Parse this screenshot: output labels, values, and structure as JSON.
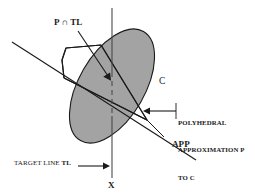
{
  "figure": {
    "type": "geometry-diagram",
    "background_color": "#ffffff",
    "stroke_color": "#1a1a1a",
    "region_fill_color": "#a3a3a3",
    "labels": {
      "intersection": "P ∩ TL",
      "convex_set": "C",
      "approximation_line": "APP",
      "polyhedral_line1": "POLYHEDRAL",
      "polyhedral_line2": "APPROXIMATION P",
      "polyhedral_line3": "TO C",
      "target_line_text": "TARGET LINE ",
      "target_line_bold": "TL",
      "axis": "X"
    },
    "elements": {
      "convex_region_name": "ellipse-C",
      "polyhedron_name": "polygon-P",
      "target_line_name": "vertical-target-line-TL",
      "app_line_name": "diagonal-approximation-line-APP"
    }
  }
}
